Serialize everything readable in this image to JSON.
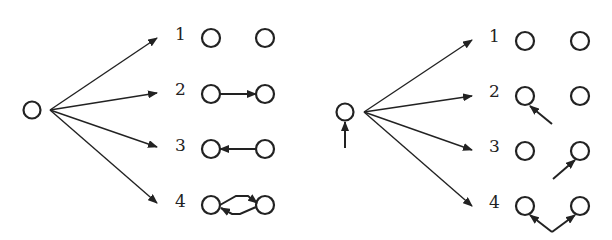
{
  "diagrams": [
    {
      "id": "left",
      "source_node": {
        "has_self_arrow": false
      },
      "branches": [
        {
          "label": "1",
          "relation": "none"
        },
        {
          "label": "2",
          "relation": "left-to-right arrow"
        },
        {
          "label": "3",
          "relation": "right-to-left arrow"
        },
        {
          "label": "4",
          "relation": "bidirectional arrows"
        }
      ]
    },
    {
      "id": "right",
      "source_node": {
        "has_self_arrow": true
      },
      "branches": [
        {
          "label": "1",
          "relation": "none"
        },
        {
          "label": "2",
          "relation": "external arrow into left node"
        },
        {
          "label": "3",
          "relation": "external arrow into right node"
        },
        {
          "label": "4",
          "relation": "external arrows into both nodes"
        }
      ]
    }
  ],
  "colors": {
    "stroke": "#222222",
    "background": "#ffffff"
  }
}
